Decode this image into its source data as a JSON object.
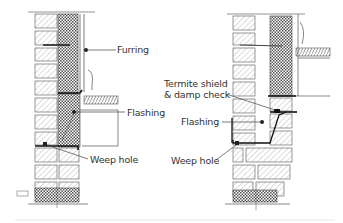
{
  "diagram": {
    "type": "construction-section-detail",
    "colors": {
      "line": "#3a3a3a",
      "hatch": "#9a9a9a",
      "flashing": "#222222",
      "background": "#ffffff"
    },
    "left_detail": {
      "labels": {
        "furring": "Furring",
        "flashing": "Flashing",
        "weep_hole": "Weep hole"
      }
    },
    "right_detail": {
      "labels": {
        "termite_line1": "Termite shield",
        "termite_line2": "& damp check",
        "flashing": "Flashing",
        "weep_hole": "Weep hole"
      }
    }
  }
}
